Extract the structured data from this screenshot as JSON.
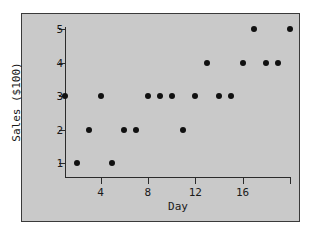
{
  "chart_data": {
    "type": "scatter",
    "title": "",
    "xlabel": "Day",
    "ylabel": "Sales ($100)",
    "x": [
      1,
      2,
      3,
      4,
      5,
      6,
      7,
      8,
      9,
      10,
      11,
      12,
      13,
      14,
      15,
      16,
      17,
      18,
      19,
      20
    ],
    "y": [
      3,
      1,
      2,
      3,
      1,
      2,
      2,
      3,
      3,
      3,
      2,
      3,
      4,
      3,
      3,
      4,
      5,
      4,
      4,
      5
    ],
    "points": [
      {
        "x": 1,
        "y": 3
      },
      {
        "x": 2,
        "y": 1
      },
      {
        "x": 3,
        "y": 2
      },
      {
        "x": 4,
        "y": 3
      },
      {
        "x": 5,
        "y": 1
      },
      {
        "x": 6,
        "y": 2
      },
      {
        "x": 7,
        "y": 2
      },
      {
        "x": 8,
        "y": 3
      },
      {
        "x": 9,
        "y": 3
      },
      {
        "x": 10,
        "y": 3
      },
      {
        "x": 11,
        "y": 2
      },
      {
        "x": 12,
        "y": 3
      },
      {
        "x": 13,
        "y": 4
      },
      {
        "x": 14,
        "y": 3
      },
      {
        "x": 15,
        "y": 3
      },
      {
        "x": 16,
        "y": 4
      },
      {
        "x": 17,
        "y": 5
      },
      {
        "x": 18,
        "y": 4
      },
      {
        "x": 19,
        "y": 4
      },
      {
        "x": 20,
        "y": 5
      }
    ],
    "xlim": [
      1,
      20
    ],
    "ylim": [
      1,
      5
    ],
    "xticks": [
      4,
      8,
      12,
      16,
      20
    ],
    "xtick_labels": [
      "4",
      "8",
      "12",
      "16",
      ""
    ],
    "yticks": [
      1,
      2,
      3,
      4,
      5
    ],
    "ytick_labels": [
      "1",
      "2",
      "3",
      "4",
      "5"
    ],
    "grid": false,
    "legend": false,
    "marker_color": "#111111",
    "panel_background": "#c9c9c9",
    "figure_background": "#ffffff",
    "axis_color": "#2b2b2b"
  }
}
